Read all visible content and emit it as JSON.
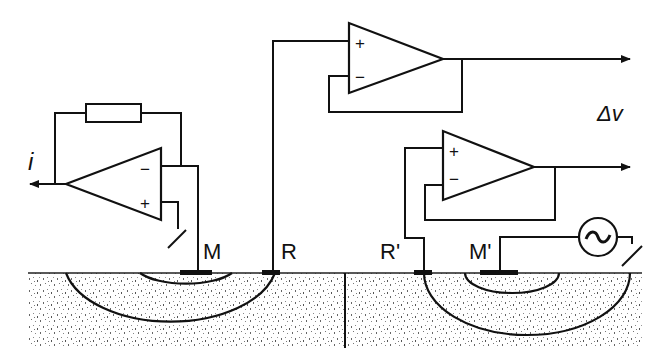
{
  "diagram": {
    "type": "electrode measurement circuit",
    "labels": {
      "current_output": "i",
      "voltage_output": "Δv",
      "electrode_m": "M",
      "electrode_r": "R",
      "electrode_r_prime": "R'",
      "electrode_m_prime": "M'"
    },
    "opamps": [
      {
        "id": "current-amplifier",
        "plus": "+",
        "minus": "−",
        "orientation": "left",
        "feedback": "resistor"
      },
      {
        "id": "buffer-r",
        "plus": "+",
        "minus": "−",
        "orientation": "right",
        "feedback": "voltage-follower"
      },
      {
        "id": "buffer-r-prime",
        "plus": "+",
        "minus": "−",
        "orientation": "right",
        "feedback": "voltage-follower"
      }
    ],
    "source": {
      "symbol": "~",
      "type": "AC voltage source"
    },
    "colors": {
      "line": "#111111",
      "soil_speckle": "#555555",
      "background": "#ffffff"
    }
  }
}
